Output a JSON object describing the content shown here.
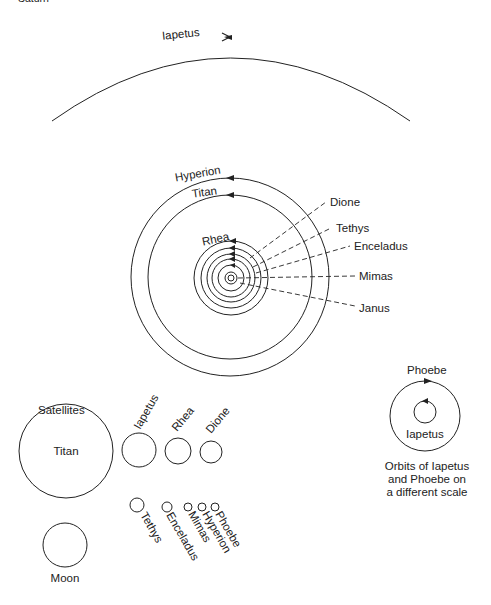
{
  "header": {
    "cropped_title": "Saturn"
  },
  "outer_orbit": {
    "label": "Iapetus"
  },
  "inner_system": {
    "orbits": [
      {
        "label": "Hyperion"
      },
      {
        "label": "Titan"
      },
      {
        "label": "Rhea"
      }
    ],
    "callouts": [
      {
        "label": "Dione"
      },
      {
        "label": "Tethys"
      },
      {
        "label": "Enceladus"
      },
      {
        "label": "Mimas"
      },
      {
        "label": "Janus"
      }
    ]
  },
  "inset": {
    "outer_label": "Phoebe",
    "inner_label": "Iapetus",
    "caption": [
      "Orbits of Iapetus",
      "and Phoebe on",
      "a different scale"
    ]
  },
  "satellites": {
    "title": "Satellites",
    "large": [
      {
        "label": "Titan"
      },
      {
        "label": "Iapetus"
      },
      {
        "label": "Rhea"
      },
      {
        "label": "Dione"
      }
    ],
    "small": [
      {
        "label": "Tethys"
      },
      {
        "label": "Enceladus"
      },
      {
        "label": "Mimas"
      },
      {
        "label": "Hyperion"
      },
      {
        "label": "Phoebe"
      }
    ],
    "reference": {
      "label": "Moon"
    }
  }
}
